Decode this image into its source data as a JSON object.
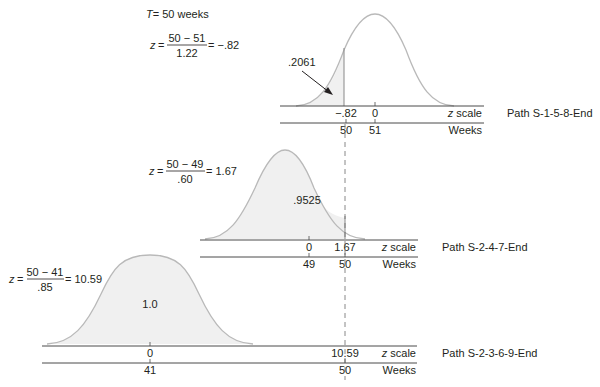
{
  "header": {
    "T_label": "T",
    "T_value": "= 50 weeks"
  },
  "panels": [
    {
      "path_label": "Path S-1-5-8-End",
      "formula": {
        "z": "z",
        "eq": "=",
        "numerator": "50 − 51",
        "denominator": "1.22",
        "result": "= −.82"
      },
      "area_label": ".2061",
      "z_ticks": [
        "−.82",
        "0"
      ],
      "week_ticks": [
        "50",
        "51"
      ],
      "z_axis_label": "z scale",
      "week_axis_label": "Weeks"
    },
    {
      "path_label": "Path S-2-4-7-End",
      "formula": {
        "z": "z",
        "eq": "=",
        "numerator": "50 − 49",
        "denominator": ".60",
        "result": "= 1.67"
      },
      "area_label": ".9525",
      "z_ticks": [
        "0",
        "1.67"
      ],
      "week_ticks": [
        "49",
        "50"
      ],
      "z_axis_label": "z scale",
      "week_axis_label": "Weeks"
    },
    {
      "path_label": "Path S-2-3-6-9-End",
      "formula": {
        "z": "z",
        "eq": "=",
        "numerator": "50 − 41",
        "denominator": ".85",
        "result": "= 10.59"
      },
      "area_label": "1.0",
      "z_ticks": [
        "0",
        "10.59"
      ],
      "week_ticks": [
        "41",
        "50"
      ],
      "z_axis_label": "z scale",
      "week_axis_label": "Weeks"
    }
  ],
  "colors": {
    "curve": "#b9b9b9",
    "shade": "#f0f0f0",
    "axis": "#4a4a4a",
    "text": "#231f20"
  }
}
